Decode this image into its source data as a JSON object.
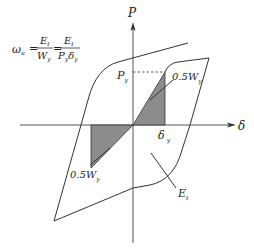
{
  "diagram": {
    "formula": {
      "lhs": "ω",
      "lhs_sub": "u",
      "eq": "=",
      "frac1_num": "E",
      "frac1_num_sub": "t",
      "frac1_den": "W",
      "frac1_den_sub": "y",
      "frac2_num": "E",
      "frac2_num_sub": "t",
      "frac2_den_p": "P",
      "frac2_den_p_sub": "y",
      "frac2_den_d": "δ",
      "frac2_den_d_sub": "y"
    },
    "axes": {
      "vertical_label": "P",
      "horizontal_label": "δ"
    },
    "labels": {
      "py": "P",
      "py_sub": "y",
      "dy": "δ",
      "dy_sub": "y",
      "half_wy_upper": "0.5W",
      "half_wy_upper_sub": "y",
      "half_wy_lower": "0.5W",
      "half_wy_lower_sub": "y",
      "et": "E",
      "et_sub": "t"
    },
    "colors": {
      "shade": "#8c8c8c",
      "line": "#333333"
    }
  }
}
